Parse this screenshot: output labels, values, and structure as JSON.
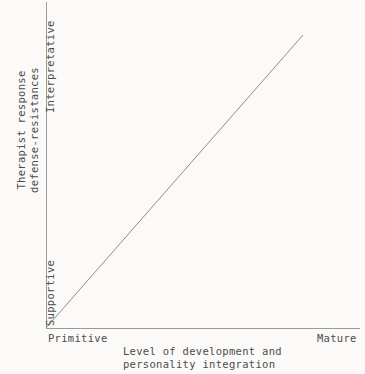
{
  "chart_data": {
    "type": "line",
    "title": "",
    "xlabel": "Level of development and personality integration",
    "xlabel_lines": [
      "Level of development and",
      "personality integration"
    ],
    "ylabel": "Therapist response defense-resistances",
    "ylabel_lines": [
      "Therapist response",
      "defense-resistances"
    ],
    "x_tick_labels": [
      "Primitive",
      "Mature"
    ],
    "y_tick_labels": [
      "Supportive",
      "Interpretative"
    ],
    "xlim": [
      0,
      1
    ],
    "ylim": [
      0,
      1
    ],
    "grid": false,
    "legend": "none",
    "series": [
      {
        "name": "therapist-response-trend",
        "x": [
          0,
          1
        ],
        "y": [
          0,
          1
        ],
        "color": "#8d8d8b",
        "description": "Straight ascending line from origin (Primitive, Supportive) to upper right (Mature, Interpretative)"
      }
    ],
    "line_endpoints_px": {
      "start": [
        46,
        328
      ],
      "end": [
        303,
        35
      ]
    }
  },
  "axes": {
    "y_axis_name": "vertical-axis",
    "x_axis_name": "horizontal-axis"
  },
  "colors": {
    "background": "#fbfaf8",
    "text": "#4d4d4b",
    "axis": "#9a9a98",
    "data_line": "#8d8d8b"
  }
}
